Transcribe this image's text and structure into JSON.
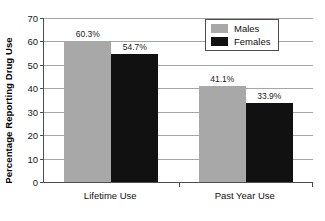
{
  "chart_data": {
    "type": "bar",
    "title": "",
    "subtitle": "",
    "xlabel": "",
    "ylabel": "Percentage Reporting Drug Use",
    "categories": [
      "Lifetime Use",
      "Past Year Use"
    ],
    "series": [
      {
        "name": "Males",
        "color": "#a8a8a8",
        "values": [
          60.3,
          41.1
        ],
        "labels": [
          "60.3%",
          "41.1%"
        ]
      },
      {
        "name": "Females",
        "color": "#111111",
        "values": [
          54.7,
          33.9
        ],
        "labels": [
          "54.7%",
          "33.9%"
        ]
      }
    ],
    "ylim": [
      0,
      70
    ],
    "yticks": [
      0,
      10,
      20,
      30,
      40,
      50,
      60,
      70
    ],
    "ytick_labels": [
      "0",
      "10",
      "20",
      "30",
      "40",
      "50",
      "60",
      "70"
    ],
    "grid": true,
    "grid_axis": "y",
    "legend_position": "top-right",
    "legend_entries": [
      "Males",
      "Females"
    ],
    "data_labels_shown": true,
    "axis_color": "#4d4d4d",
    "gridline_color": "#a6a6a6",
    "background_color": "#ffffff"
  }
}
